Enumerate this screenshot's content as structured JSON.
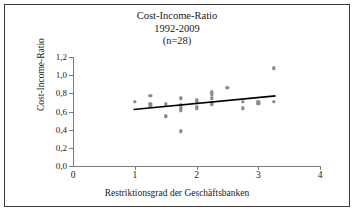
{
  "figure": {
    "title_lines": [
      "Cost-Income-Ratio",
      "1992-2009",
      "(n=28)"
    ],
    "title_line1": "Cost-Income-Ratio",
    "title_line2": "1992-2009",
    "title_line3": "(n=28)",
    "frame_color": "#3a3a3a",
    "background_color": "#ffffff",
    "marker_color": "#8a8a8a",
    "trendline_color": "#000000",
    "axis_color": "#7b7b7b"
  },
  "axes": {
    "y_title": "Cost-Income-Ratio",
    "x_title": "Restriktionsgrad der Geschäftsbanken",
    "y_tick_labels": [
      "0,0",
      "0,2",
      "0,4",
      "0,6",
      "0,8",
      "1,0",
      "1,2"
    ],
    "x_tick_labels": [
      "0",
      "1",
      "2",
      "3",
      "4"
    ]
  },
  "chart_data": {
    "type": "scatter",
    "title": "Cost-Income-Ratio 1992-2009 (n=28)",
    "subtitle": "1992-2009 (n=28)",
    "xlabel": "Restriktionsgrad der Geschäftsbanken",
    "ylabel": "Cost-Income-Ratio",
    "xlim": [
      0,
      4
    ],
    "ylim": [
      0.0,
      1.2
    ],
    "xticks": [
      0,
      1,
      2,
      3,
      4
    ],
    "yticks": [
      0.0,
      0.2,
      0.4,
      0.6,
      0.8,
      1.0,
      1.2
    ],
    "n": 28,
    "grid": false,
    "legend": false,
    "points": [
      {
        "x": 1.0,
        "y": 0.705
      },
      {
        "x": 1.25,
        "y": 0.775
      },
      {
        "x": 1.25,
        "y": 0.685
      },
      {
        "x": 1.25,
        "y": 0.665
      },
      {
        "x": 1.5,
        "y": 0.68
      },
      {
        "x": 1.5,
        "y": 0.555
      },
      {
        "x": 1.5,
        "y": 0.54
      },
      {
        "x": 1.75,
        "y": 0.745
      },
      {
        "x": 1.75,
        "y": 0.67
      },
      {
        "x": 1.75,
        "y": 0.64
      },
      {
        "x": 1.75,
        "y": 0.615
      },
      {
        "x": 1.75,
        "y": 0.38
      },
      {
        "x": 2.0,
        "y": 0.725
      },
      {
        "x": 2.0,
        "y": 0.7
      },
      {
        "x": 2.0,
        "y": 0.65
      },
      {
        "x": 2.0,
        "y": 0.635
      },
      {
        "x": 2.25,
        "y": 0.81
      },
      {
        "x": 2.25,
        "y": 0.79
      },
      {
        "x": 2.25,
        "y": 0.745
      },
      {
        "x": 2.25,
        "y": 0.69
      },
      {
        "x": 2.25,
        "y": 0.68
      },
      {
        "x": 2.5,
        "y": 0.86
      },
      {
        "x": 2.75,
        "y": 0.705
      },
      {
        "x": 2.75,
        "y": 0.635
      },
      {
        "x": 3.0,
        "y": 0.7
      },
      {
        "x": 3.0,
        "y": 0.685
      },
      {
        "x": 3.25,
        "y": 1.075
      },
      {
        "x": 3.25,
        "y": 0.705
      }
    ],
    "trendline": {
      "x_start": 0.98,
      "y_start": 0.622,
      "x_end": 3.28,
      "y_end": 0.772
    }
  }
}
